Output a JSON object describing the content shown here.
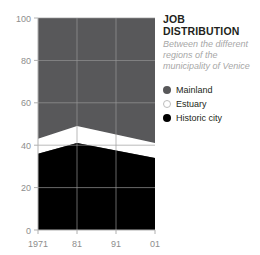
{
  "header": {
    "title": "JOB DISTRIBUTION",
    "subtitle": "Between the different regions of the municipality of Venice"
  },
  "legend": {
    "position": "right",
    "items": [
      {
        "label": "Mainland",
        "marker": "filled-circle-gray",
        "color": "#58585a"
      },
      {
        "label": "Estuary",
        "marker": "hollow-circle-white",
        "color": "#ffffff"
      },
      {
        "label": "Historic city",
        "marker": "filled-circle-black",
        "color": "#000000"
      }
    ]
  },
  "axes": {
    "y_ticks": [
      "0",
      "20",
      "40",
      "60",
      "80",
      "100"
    ],
    "x_ticks": [
      "1971",
      "81",
      "91",
      "01"
    ]
  },
  "chart_data": {
    "type": "area",
    "stacked": true,
    "normalized": true,
    "title": "JOB DISTRIBUTION",
    "subtitle": "Between the different regions of the municipality of Venice",
    "xlabel": "",
    "ylabel": "",
    "x": [
      "1971",
      "81",
      "91",
      "01"
    ],
    "categories": [
      "1971",
      "81",
      "91",
      "01"
    ],
    "xtick_labels": [
      "1971",
      "81",
      "91",
      "01"
    ],
    "ytick_labels": [
      "0",
      "20",
      "40",
      "60",
      "80",
      "100"
    ],
    "ylim": [
      0,
      100
    ],
    "ytick_values": [
      0,
      20,
      40,
      60,
      80,
      100
    ],
    "grid": true,
    "grid_color": "#8d8d8d",
    "legend_position": "right",
    "series": [
      {
        "name": "Historic city",
        "color": "#000000",
        "values": [
          36,
          41,
          37.5,
          34
        ],
        "cumulative_top": [
          36,
          41,
          37.5,
          34
        ]
      },
      {
        "name": "Estuary",
        "color": "#ffffff",
        "values": [
          7,
          8,
          7.5,
          7
        ],
        "cumulative_top": [
          43,
          49,
          45,
          41
        ]
      },
      {
        "name": "Mainland",
        "color": "#58585a",
        "values": [
          57,
          51,
          55,
          59
        ],
        "cumulative_top": [
          100,
          100,
          100,
          100
        ]
      }
    ]
  }
}
